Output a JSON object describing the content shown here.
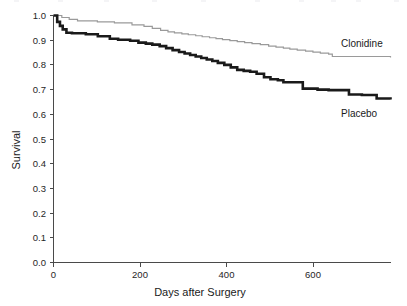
{
  "figure": {
    "background_color": "#ffffff",
    "width": 407,
    "height": 306
  },
  "axes": {
    "x_title": "Days after Surgery",
    "y_title": "Survival",
    "x_ticks": [
      "0",
      "200",
      "400",
      "600"
    ],
    "y_ticks": [
      "1.0",
      "0.9",
      "0.8",
      "0.7",
      "0.6",
      "0.5",
      "0.4",
      "0.3",
      "0.2",
      "0.1",
      "0.0"
    ]
  },
  "series_labels": {
    "clonidine": "Clonidine",
    "placebo": "Placebo"
  },
  "chart_data": {
    "type": "line",
    "title": "",
    "subtitle": "",
    "xlabel": "Days after Surgery",
    "ylabel": "Survival",
    "xlim": [
      0,
      730
    ],
    "ylim": [
      0.0,
      1.0
    ],
    "xticks": [
      0,
      200,
      400,
      600
    ],
    "yticks": [
      0.0,
      0.1,
      0.2,
      0.3,
      0.4,
      0.5,
      0.6,
      0.7,
      0.8,
      0.9,
      1.0
    ],
    "grid": false,
    "legend_position": "inline-right-of-curve",
    "step_type": "post",
    "annotations": [
      {
        "text": "Clonidine",
        "x": 660,
        "y": 0.885
      },
      {
        "text": "Placebo",
        "x": 665,
        "y": 0.6
      }
    ],
    "series": [
      {
        "name": "Clonidine",
        "color": "#9a9a9a",
        "line_width": 1.2,
        "style": "kaplan-meier-step",
        "x": [
          0,
          18,
          34,
          52,
          95,
          132,
          170,
          196,
          214,
          232,
          248,
          262,
          278,
          292,
          308,
          322,
          338,
          352,
          366,
          382,
          398,
          414,
          430,
          448,
          466,
          482,
          498,
          512,
          528,
          546,
          562,
          578,
          596,
          604,
          730
        ],
        "y": [
          1.0,
          0.992,
          0.984,
          0.978,
          0.974,
          0.97,
          0.962,
          0.956,
          0.948,
          0.94,
          0.934,
          0.93,
          0.926,
          0.922,
          0.918,
          0.914,
          0.91,
          0.906,
          0.902,
          0.898,
          0.894,
          0.89,
          0.886,
          0.882,
          0.876,
          0.872,
          0.868,
          0.864,
          0.86,
          0.856,
          0.852,
          0.848,
          0.844,
          0.834,
          0.83
        ]
      },
      {
        "name": "Placebo",
        "color": "#1a1a1a",
        "line_width": 2.6,
        "style": "kaplan-meier-step",
        "x": [
          0,
          8,
          14,
          20,
          28,
          40,
          70,
          96,
          122,
          140,
          166,
          184,
          200,
          214,
          230,
          244,
          258,
          272,
          284,
          296,
          308,
          320,
          332,
          344,
          356,
          370,
          384,
          398,
          412,
          426,
          440,
          456,
          470,
          486,
          498,
          540,
          572,
          596,
          640,
          668,
          700,
          730
        ],
        "y": [
          1.0,
          0.974,
          0.958,
          0.944,
          0.93,
          0.928,
          0.924,
          0.916,
          0.906,
          0.902,
          0.898,
          0.89,
          0.886,
          0.882,
          0.876,
          0.868,
          0.86,
          0.852,
          0.846,
          0.84,
          0.834,
          0.828,
          0.822,
          0.816,
          0.808,
          0.8,
          0.79,
          0.78,
          0.776,
          0.772,
          0.764,
          0.75,
          0.742,
          0.738,
          0.73,
          0.704,
          0.7,
          0.698,
          0.68,
          0.678,
          0.664,
          0.66
        ]
      }
    ]
  }
}
